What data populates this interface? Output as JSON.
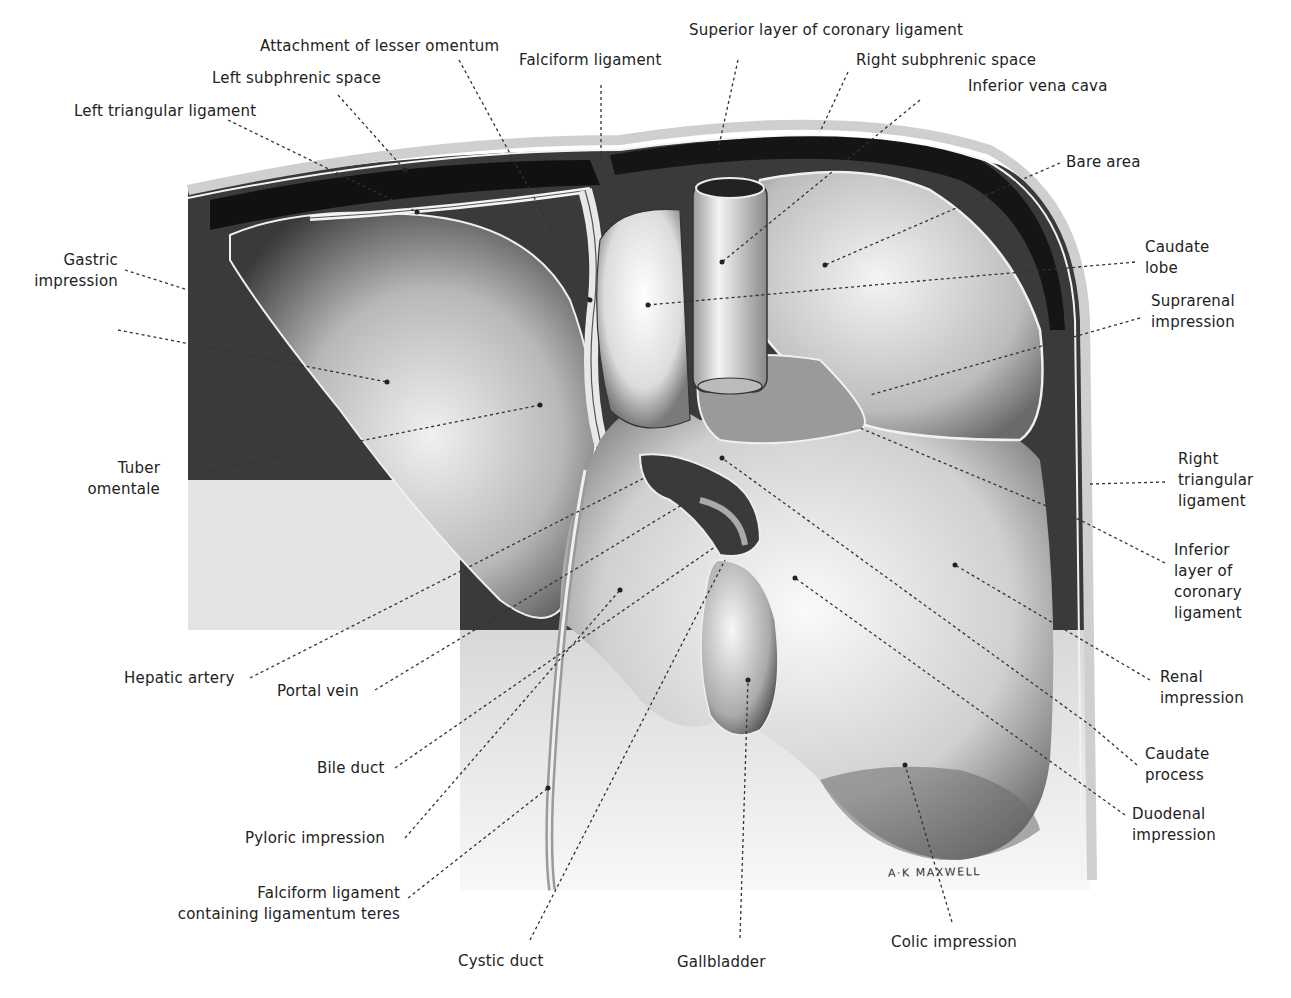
{
  "figure": {
    "artist_signature": "A·K MAXWELL"
  },
  "labels": {
    "attachment_lesser_omentum": [
      "Attachment of lesser omentum"
    ],
    "falciform_ligament": [
      "Falciform ligament"
    ],
    "superior_coronary": [
      "Superior layer of coronary ligament"
    ],
    "right_subphrenic": [
      "Right subphrenic space"
    ],
    "left_subphrenic": [
      "Left subphrenic space"
    ],
    "inferior_vena_cava": [
      "Inferior vena cava"
    ],
    "left_triangular": [
      "Left triangular ligament"
    ],
    "bare_area": [
      "Bare area"
    ],
    "gastric_impression": [
      "Gastric",
      "impression"
    ],
    "caudate_lobe": [
      "Caudate",
      "lobe"
    ],
    "suprarenal_impression": [
      "Suprarenal",
      "impression"
    ],
    "tuber_omentale": [
      "Tuber",
      "omentale"
    ],
    "right_triangular": [
      "Right",
      "triangular",
      "ligament"
    ],
    "inferior_coronary": [
      "Inferior",
      "layer of",
      "coronary",
      "ligament"
    ],
    "hepatic_artery": [
      "Hepatic artery"
    ],
    "portal_vein": [
      "Portal vein"
    ],
    "renal_impression": [
      "Renal",
      "impression"
    ],
    "bile_duct": [
      "Bile duct"
    ],
    "caudate_process": [
      "Caudate",
      "process"
    ],
    "pyloric_impression": [
      "Pyloric impression"
    ],
    "duodenal_impression": [
      "Duodenal",
      "impression"
    ],
    "falciform_teres": [
      "Falciform ligament",
      "containing ligamentum teres"
    ],
    "colic_impression": [
      "Colic impression"
    ],
    "cystic_duct": [
      "Cystic duct"
    ],
    "gallbladder": [
      "Gallbladder"
    ]
  },
  "colors": {
    "background": "#ffffff",
    "text": "#222222",
    "organ_dark": "#2a2a2a",
    "organ_mid": "#8a8a8a",
    "organ_light": "#e8e8e8"
  }
}
